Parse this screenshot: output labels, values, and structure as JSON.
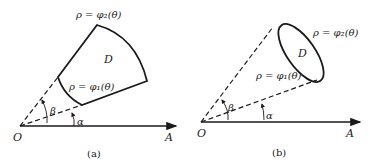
{
  "figure_a": {
    "caption": "(a)",
    "origin_label": "O",
    "axis_end_label": "A",
    "region_label": "D",
    "outer_curve_label": "ρ = φ₂(θ)",
    "inner_curve_label": "ρ = φ₁(θ)",
    "angle_alpha_label": "α",
    "angle_beta_label": "β"
  },
  "figure_b": {
    "caption": "(b)",
    "origin_label": "O",
    "axis_end_label": "A",
    "region_label": "D",
    "outer_curve_label": "ρ = φ₂(θ)",
    "inner_curve_label": "ρ = φ₁(θ)",
    "angle_alpha_label": "α",
    "angle_beta_label": "β"
  },
  "colors": {
    "stroke": "#1a1a1a",
    "text": "#222222",
    "background": "#ffffff"
  }
}
